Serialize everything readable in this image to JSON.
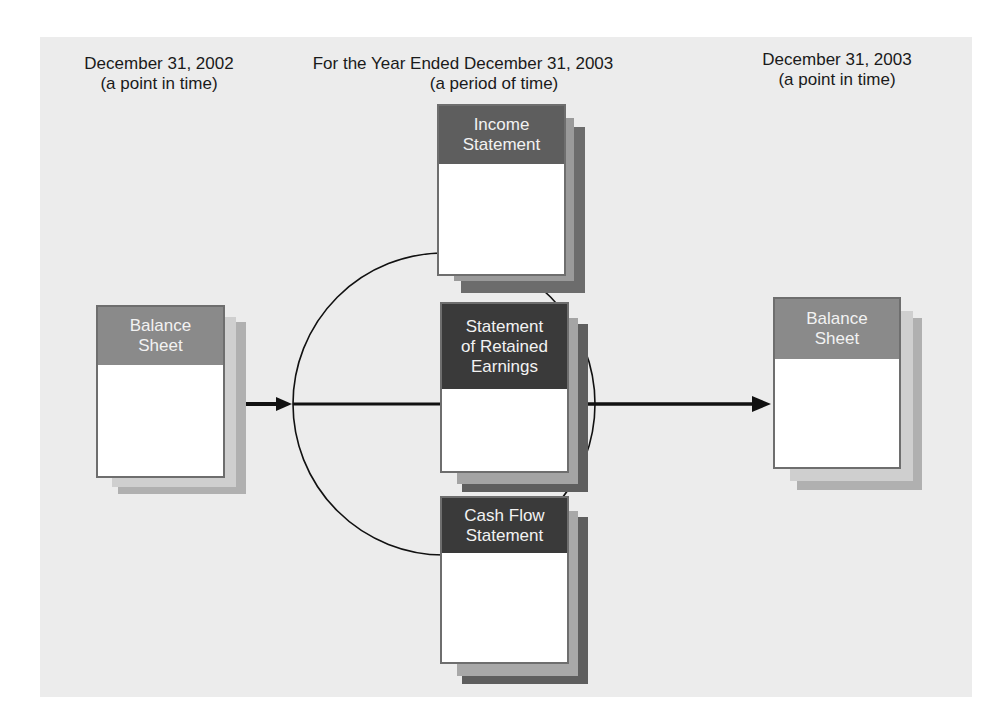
{
  "diagram": {
    "colors": {
      "panel_background": "#ececec",
      "balance_sheet_header": "#8a8a8a",
      "income_header": "#5e5e5e",
      "retained_header": "#3a3a3a",
      "cashflow_header": "#3a3a3a",
      "shadow_light": "#c4c4c4",
      "shadow_mid": "#a8a8a8",
      "shadow_dark": "#6a6a6a",
      "line": "#111111"
    },
    "captions": {
      "left": {
        "line1": "December 31, 2002",
        "line2": "(a point in time)"
      },
      "center": {
        "line1": "For the Year Ended December 31, 2003",
        "line2": "(a period of time)"
      },
      "right": {
        "line1": "December 31, 2003",
        "line2": "(a point in time)"
      }
    },
    "documents": {
      "balance_sheet_start": {
        "line1": "Balance",
        "line2": "Sheet"
      },
      "income_statement": {
        "line1": "Income",
        "line2": "Statement"
      },
      "retained_earnings": {
        "line1": "Statement",
        "line2": "of Retained",
        "line3": "Earnings"
      },
      "cash_flow": {
        "line1": "Cash Flow",
        "line2": "Statement"
      },
      "balance_sheet_end": {
        "line1": "Balance",
        "line2": "Sheet"
      }
    },
    "connectors": [
      {
        "from": "Balance Sheet (Dec 31, 2002)",
        "to": "period circle",
        "type": "arrow"
      },
      {
        "from": "period circle",
        "to": "Balance Sheet (Dec 31, 2003)",
        "type": "arrow"
      }
    ]
  }
}
